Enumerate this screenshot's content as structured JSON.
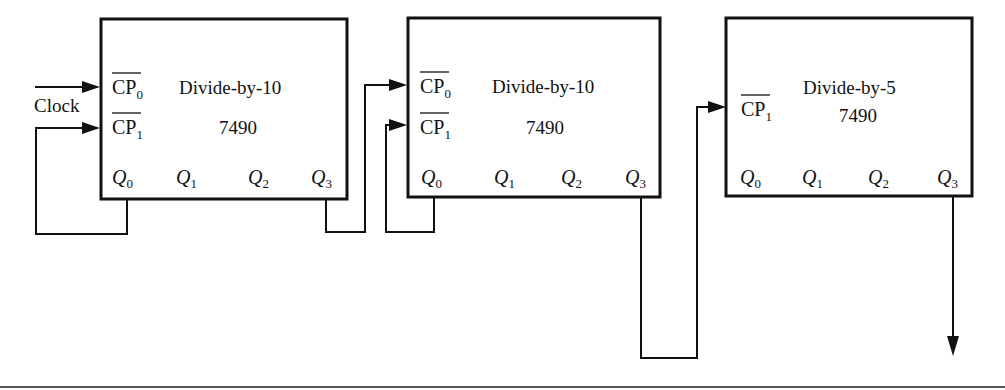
{
  "diagram": {
    "type": "7490 cascaded counter logic diagram",
    "clock_label": "Clock",
    "counters": [
      {
        "id": "counter-1",
        "title": "Divide-by-10",
        "part": "7490",
        "inputs": [
          "CP0",
          "CP1"
        ],
        "input_labels": {
          "cp0": "CP",
          "cp0_sub": "0",
          "cp1": "CP",
          "cp1_sub": "1"
        },
        "outputs": [
          {
            "q": "Q",
            "sub": "0"
          },
          {
            "q": "Q",
            "sub": "1"
          },
          {
            "q": "Q",
            "sub": "2"
          },
          {
            "q": "Q",
            "sub": "3"
          }
        ]
      },
      {
        "id": "counter-2",
        "title": "Divide-by-10",
        "part": "7490",
        "inputs": [
          "CP0",
          "CP1"
        ],
        "input_labels": {
          "cp0": "CP",
          "cp0_sub": "0",
          "cp1": "CP",
          "cp1_sub": "1"
        },
        "outputs": [
          {
            "q": "Q",
            "sub": "0"
          },
          {
            "q": "Q",
            "sub": "1"
          },
          {
            "q": "Q",
            "sub": "2"
          },
          {
            "q": "Q",
            "sub": "3"
          }
        ]
      },
      {
        "id": "counter-3",
        "title": "Divide-by-5",
        "part": "7490",
        "inputs": [
          "CP1"
        ],
        "input_labels": {
          "cp1": "CP",
          "cp1_sub": "1"
        },
        "outputs": [
          {
            "q": "Q",
            "sub": "0"
          },
          {
            "q": "Q",
            "sub": "1"
          },
          {
            "q": "Q",
            "sub": "2"
          },
          {
            "q": "Q",
            "sub": "3"
          }
        ]
      }
    ],
    "connections": [
      "Clock -> counter-1 CP0",
      "counter-1 Q0 -> counter-1 CP1",
      "counter-1 Q3 -> counter-2 CP0",
      "counter-2 Q0 -> counter-2 CP1",
      "counter-2 Q3 -> counter-3 CP1",
      "counter-3 Q3 -> output"
    ]
  }
}
